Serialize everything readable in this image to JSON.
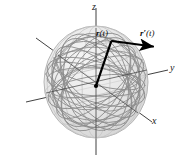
{
  "figure": {
    "name": "vector-function-on-sphere",
    "background_color": "#ffffff"
  },
  "axes": {
    "z": {
      "label": "z",
      "name": "z-axis"
    },
    "y": {
      "label": "y",
      "name": "y-axis"
    },
    "x": {
      "label": "x",
      "name": "x-axis"
    },
    "color": "#2b2b2b",
    "origin": {
      "x": 96,
      "y": 86
    }
  },
  "vectors": [
    {
      "name": "position-vector",
      "label_bold": "r",
      "label_prime": "",
      "label_arg": "(t)",
      "color": "#000000",
      "from": {
        "x": 96,
        "y": 86
      },
      "to": {
        "x": 111,
        "y": 41
      }
    },
    {
      "name": "derivative-vector",
      "label_bold": "r",
      "label_prime": "′",
      "label_arg": "(t)",
      "color": "#000000",
      "from": {
        "x": 111,
        "y": 41
      },
      "to": {
        "x": 156,
        "y": 47
      }
    }
  ],
  "sphere": {
    "name": "sphere",
    "center": {
      "x": 96,
      "y": 82
    },
    "radius_x": 52,
    "radius_y": 56,
    "fill_color": "#e8e8e8",
    "outline_color": "#b4b4b4",
    "gridline_color": "#c2c2c2"
  },
  "curve": {
    "name": "spherical-curve",
    "color": "#8f8f8f",
    "description": "dense closed curve winding over the surface of the sphere"
  }
}
